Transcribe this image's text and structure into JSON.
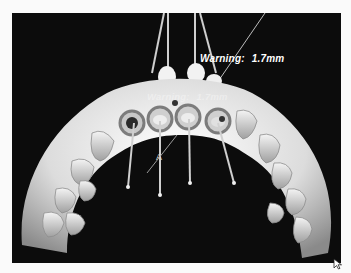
{
  "viewport": {
    "description": "3D dental arch model with implant guide sleeves",
    "background": "#0c0c0c",
    "model_color": "#e8e8e8"
  },
  "warnings": {
    "main": {
      "prefix": "Warning:",
      "value": "1.7mm"
    },
    "ghost": {
      "prefix": "Warning:",
      "value": "1.7mm"
    }
  },
  "marker": {
    "label": "A"
  },
  "icons": {
    "cursor": "arrow-cursor-icon"
  },
  "sleeves": [
    {
      "id": 1,
      "cx": 120,
      "cy": 110
    },
    {
      "id": 2,
      "cx": 158,
      "cy": 106
    },
    {
      "id": 3,
      "cx": 184,
      "cy": 104
    },
    {
      "id": 4,
      "cx": 216,
      "cy": 108
    }
  ]
}
